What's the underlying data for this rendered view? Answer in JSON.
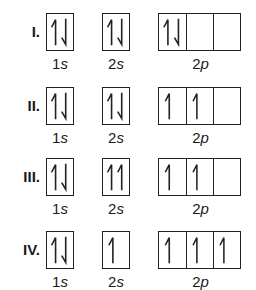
{
  "diagram": {
    "subshell_labels": {
      "s1": "1",
      "s1_letter": "s",
      "s2": "2",
      "s2_letter": "s",
      "p2": "2",
      "p2_letter": "p"
    },
    "rows": [
      {
        "label": "I.",
        "orbitals": {
          "1s": [
            "up",
            "down"
          ],
          "2s": [
            "up",
            "down"
          ],
          "2p": [
            [
              "up",
              "down"
            ],
            [],
            []
          ]
        }
      },
      {
        "label": "II.",
        "orbitals": {
          "1s": [
            "up",
            "down"
          ],
          "2s": [
            "up",
            "down"
          ],
          "2p": [
            [
              "up"
            ],
            [
              "up"
            ],
            []
          ]
        }
      },
      {
        "label": "III.",
        "orbitals": {
          "1s": [
            "up",
            "down"
          ],
          "2s": [
            "up",
            "up"
          ],
          "2p": [
            [
              "up"
            ],
            [
              "up"
            ],
            []
          ]
        }
      },
      {
        "label": "IV.",
        "orbitals": {
          "1s": [
            "up",
            "down"
          ],
          "2s": [
            "up"
          ],
          "2p": [
            [
              "up"
            ],
            [
              "up"
            ],
            [
              "up"
            ]
          ]
        }
      }
    ],
    "colors": {
      "line": "#222222",
      "background": "#ffffff"
    }
  }
}
